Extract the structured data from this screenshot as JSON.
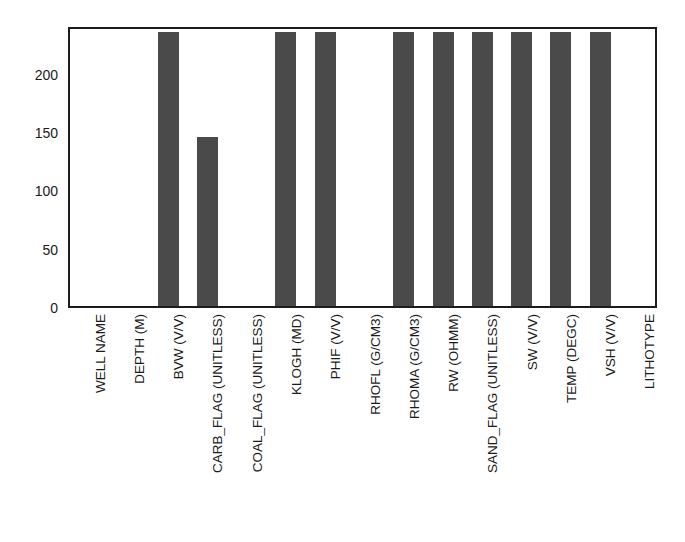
{
  "chart_data": {
    "type": "bar",
    "title": "",
    "subtitle": "",
    "xlabel": "",
    "ylabel": "",
    "ylim": [
      0,
      241
    ],
    "xlim": [
      0,
      15
    ],
    "grid": false,
    "legend": null,
    "orientation": "vertical",
    "bar_color": "#4a4a4a",
    "frame_color": "#1c1c1c",
    "background_color": "#ffffff",
    "categories": [
      "WELL NAME",
      "DEPTH (M)",
      "BVW (V/V)",
      "CARB_FLAG (UNITLESS)",
      "COAL_FLAG (UNITLESS)",
      "KLOGH (MD)",
      "PHIF (V/V)",
      "RHOFL (G/CM3)",
      "RHOMA (G/CM3)",
      "RW (OHMM)",
      "SAND_FLAG (UNITLESS)",
      "SW (V/V)",
      "TEMP (DEGC)",
      "VSH (V/V)",
      "LITHOTYPE"
    ],
    "values": [
      0,
      0,
      235,
      145,
      0,
      235,
      235,
      0,
      235,
      235,
      235,
      235,
      235,
      235,
      0
    ],
    "ytick_values": [
      0,
      50,
      100,
      150,
      200
    ],
    "ytick_labels": [
      "0",
      "50",
      "100",
      "150",
      "200"
    ],
    "xtick_labels": [
      "WELL NAME",
      "DEPTH (M)",
      "BVW (V/V)",
      "CARB_FLAG (UNITLESS)",
      "COAL_FLAG (UNITLESS)",
      "KLOGH (MD)",
      "PHIF (V/V)",
      "RHOFL (G/CM3)",
      "RHOMA (G/CM3)",
      "RW (OHMM)",
      "SAND_FLAG (UNITLESS)",
      "SW (V/V)",
      "TEMP (DEGC)",
      "VSH (V/V)",
      "LITHOTYPE"
    ],
    "annotations": []
  }
}
